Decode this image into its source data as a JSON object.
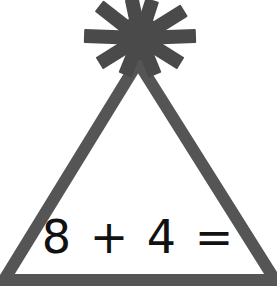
{
  "figure": {
    "shape": "triangle",
    "decoration": "starburst",
    "equation": "8 + 4 =",
    "colors": {
      "stroke": "#555555",
      "starburst": "#4a4a4a",
      "text": "#111111",
      "background": "#ffffff"
    }
  }
}
